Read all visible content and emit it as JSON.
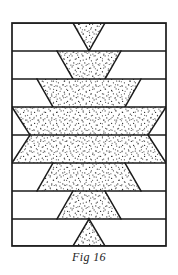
{
  "figure": {
    "caption": "Fig 16",
    "title": "Fig 16",
    "type": "geometric-line-diagram",
    "frame": {
      "x": 12,
      "y": 23,
      "width": 154,
      "height": 223,
      "stroke": "#1a1a1a",
      "stroke_width": 1.6,
      "fill": "#ffffff"
    },
    "band_count": 8,
    "band_dividers_y": [
      23,
      51,
      79,
      107,
      135,
      163,
      191,
      219,
      246
    ],
    "center_x": 89,
    "colors": {
      "stroke": "#1a1a1a",
      "fill": "#ffffff",
      "stipple": "#2b2b2b",
      "caption": "#1d1d1d"
    },
    "bands": [
      {
        "index": 1,
        "name": "band-1",
        "shape": "inverted-triangle",
        "top_y": 23,
        "bottom_y": 51,
        "top_left_x": 73,
        "top_right_x": 105,
        "bottom_left_x": 89,
        "bottom_right_x": 89,
        "stippled": true
      },
      {
        "index": 2,
        "name": "band-2",
        "shape": "inverted-trapezoid",
        "top_y": 51,
        "bottom_y": 79,
        "top_left_x": 57,
        "top_right_x": 121,
        "bottom_left_x": 73,
        "bottom_right_x": 105,
        "stippled": true
      },
      {
        "index": 3,
        "name": "band-3",
        "shape": "inverted-trapezoid",
        "top_y": 79,
        "bottom_y": 107,
        "top_left_x": 37,
        "top_right_x": 141,
        "bottom_left_x": 53,
        "bottom_right_x": 125,
        "stippled": true
      },
      {
        "index": 4,
        "name": "band-4",
        "shape": "inverted-trapezoid",
        "top_y": 107,
        "bottom_y": 135,
        "top_left_x": 12,
        "top_right_x": 166,
        "bottom_left_x": 30,
        "bottom_right_x": 148,
        "stippled": true
      },
      {
        "index": 5,
        "name": "band-5",
        "shape": "upright-trapezoid",
        "top_y": 135,
        "bottom_y": 163,
        "top_left_x": 30,
        "top_right_x": 148,
        "bottom_left_x": 12,
        "bottom_right_x": 166,
        "stippled": true
      },
      {
        "index": 6,
        "name": "band-6",
        "shape": "upright-trapezoid",
        "top_y": 163,
        "bottom_y": 191,
        "top_left_x": 53,
        "top_right_x": 125,
        "bottom_left_x": 37,
        "bottom_right_x": 141,
        "stippled": true
      },
      {
        "index": 7,
        "name": "band-7",
        "shape": "upright-trapezoid",
        "top_y": 191,
        "bottom_y": 219,
        "top_left_x": 73,
        "top_right_x": 105,
        "bottom_left_x": 57,
        "bottom_right_x": 121,
        "stippled": true
      },
      {
        "index": 8,
        "name": "band-8",
        "shape": "upright-triangle",
        "top_y": 219,
        "bottom_y": 246,
        "top_left_x": 89,
        "top_right_x": 89,
        "bottom_left_x": 73,
        "bottom_right_x": 105,
        "stippled": true
      }
    ]
  }
}
